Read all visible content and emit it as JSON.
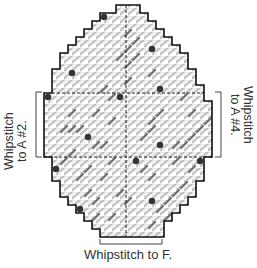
{
  "diagram": {
    "type": "needlepoint-stitch-chart",
    "shape": "egg",
    "grid": {
      "cell_px": 8,
      "origin_x": 44,
      "origin_y": 5,
      "columns": 21,
      "rows": 29,
      "row_spans": [
        [
          9,
          12
        ],
        [
          7,
          13
        ],
        [
          6,
          14
        ],
        [
          5,
          15
        ],
        [
          4,
          16
        ],
        [
          3,
          17
        ],
        [
          2,
          18
        ],
        [
          2,
          18
        ],
        [
          1,
          19
        ],
        [
          1,
          19
        ],
        [
          1,
          20
        ],
        [
          0,
          20
        ],
        [
          0,
          21
        ],
        [
          0,
          21
        ],
        [
          0,
          21
        ],
        [
          0,
          21
        ],
        [
          0,
          21
        ],
        [
          0,
          21
        ],
        [
          0,
          21
        ],
        [
          1,
          20
        ],
        [
          1,
          20
        ],
        [
          1,
          20
        ],
        [
          2,
          19
        ],
        [
          2,
          19
        ],
        [
          3,
          18
        ],
        [
          4,
          17
        ],
        [
          5,
          16
        ],
        [
          6,
          15
        ],
        [
          7,
          15
        ]
      ],
      "center_line_col": 10,
      "center_line_row": 19
    },
    "colors": {
      "outline": "#111111",
      "grid_line": "#9a9a9a",
      "stitch_light": "#c8c8c8",
      "stitch_dark": "#6e6e6e",
      "dot": "#333333",
      "background": "#ffffff"
    },
    "dots": [
      {
        "col": 7,
        "row": 1
      },
      {
        "col": 13,
        "row": 5
      },
      {
        "col": 3,
        "row": 8
      },
      {
        "col": 14,
        "row": 10
      },
      {
        "col": 9,
        "row": 11
      },
      {
        "col": 0,
        "row": 11
      },
      {
        "col": 14,
        "row": 17
      },
      {
        "col": 5,
        "row": 16
      },
      {
        "col": 19,
        "row": 19
      },
      {
        "col": 11,
        "row": 19
      },
      {
        "col": 1,
        "row": 20
      },
      {
        "col": 4,
        "row": 25
      },
      {
        "col": 13,
        "row": 24
      }
    ],
    "dark_strokes": [
      {
        "col": 10,
        "row": 3
      },
      {
        "col": 11,
        "row": 4
      },
      {
        "col": 10,
        "row": 5
      },
      {
        "col": 9,
        "row": 6
      },
      {
        "col": 11,
        "row": 6
      },
      {
        "col": 10,
        "row": 7
      },
      {
        "col": 13,
        "row": 8
      },
      {
        "col": 10,
        "row": 9
      },
      {
        "col": 7,
        "row": 10
      },
      {
        "col": 8,
        "row": 11
      },
      {
        "col": 17,
        "row": 11
      },
      {
        "col": 18,
        "row": 13
      },
      {
        "col": 3,
        "row": 13
      },
      {
        "col": 6,
        "row": 13
      },
      {
        "col": 14,
        "row": 13
      },
      {
        "col": 13,
        "row": 14
      },
      {
        "col": 2,
        "row": 15
      },
      {
        "col": 3,
        "row": 15
      },
      {
        "col": 4,
        "row": 15
      },
      {
        "col": 8,
        "row": 14
      },
      {
        "col": 13,
        "row": 15
      },
      {
        "col": 12,
        "row": 16
      },
      {
        "col": 19,
        "row": 15
      },
      {
        "col": 20,
        "row": 14
      },
      {
        "col": 3,
        "row": 18
      },
      {
        "col": 6,
        "row": 17
      },
      {
        "col": 7,
        "row": 17
      },
      {
        "col": 16,
        "row": 17
      },
      {
        "col": 17,
        "row": 17
      },
      {
        "col": 18,
        "row": 16
      },
      {
        "col": 2,
        "row": 19
      },
      {
        "col": 8,
        "row": 19
      },
      {
        "col": 16,
        "row": 19
      },
      {
        "col": 5,
        "row": 20
      },
      {
        "col": 13,
        "row": 21
      },
      {
        "col": 18,
        "row": 20
      },
      {
        "col": 4,
        "row": 21
      },
      {
        "col": 7,
        "row": 21
      },
      {
        "col": 12,
        "row": 20
      },
      {
        "col": 17,
        "row": 22
      },
      {
        "col": 16,
        "row": 23
      },
      {
        "col": 5,
        "row": 23
      },
      {
        "col": 6,
        "row": 24
      },
      {
        "col": 9,
        "row": 23
      },
      {
        "col": 15,
        "row": 24
      },
      {
        "col": 14,
        "row": 25
      },
      {
        "col": 6,
        "row": 26
      },
      {
        "col": 8,
        "row": 26
      },
      {
        "col": 10,
        "row": 24
      },
      {
        "col": 13,
        "row": 27
      },
      {
        "col": 15,
        "row": 26
      }
    ],
    "brackets": {
      "left": {
        "x": 36,
        "y1": 92,
        "y2": 157
      },
      "right": {
        "x": 221,
        "y1": 92,
        "y2": 157
      },
      "bottom": {
        "y": 244,
        "x1": 100,
        "x2": 162
      }
    }
  },
  "labels": {
    "left": {
      "line1": "Whipstitch",
      "line2": "to A #2."
    },
    "right": {
      "line1": "Whipstitch",
      "line2": "to A #4."
    },
    "bottom": "Whipstitch to F."
  }
}
